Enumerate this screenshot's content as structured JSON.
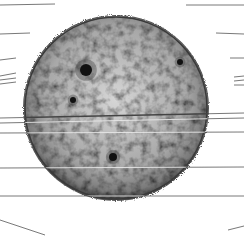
{
  "diagram": {
    "background": "#ffffff",
    "sun": {
      "cx": 116,
      "cy": 108,
      "r": 92,
      "fill_light": "#cfcfcf",
      "fill_dark": "#6a6a6a",
      "limb_color": "#3a3a3a"
    },
    "sunspots": [
      {
        "x": 86,
        "y": 70,
        "r": 6
      },
      {
        "x": 180,
        "y": 62,
        "r": 3
      },
      {
        "x": 73,
        "y": 100,
        "r": 3
      },
      {
        "x": 113,
        "y": 157,
        "r": 4
      }
    ],
    "leader_lines": [
      {
        "x1": 0,
        "y1": 5,
        "x2": 55,
        "y2": 4
      },
      {
        "x1": 0,
        "y1": 34,
        "x2": 30,
        "y2": 33
      },
      {
        "x1": 0,
        "y1": 60,
        "x2": 16,
        "y2": 58
      },
      {
        "x1": 0,
        "y1": 76,
        "x2": 16,
        "y2": 73
      },
      {
        "x1": 0,
        "y1": 80,
        "x2": 16,
        "y2": 78
      },
      {
        "x1": 0,
        "y1": 84,
        "x2": 16,
        "y2": 82
      },
      {
        "x1": 0,
        "y1": 118,
        "x2": 244,
        "y2": 113
      },
      {
        "x1": 0,
        "y1": 123,
        "x2": 244,
        "y2": 118
      },
      {
        "x1": 0,
        "y1": 133,
        "x2": 244,
        "y2": 132
      },
      {
        "x1": 0,
        "y1": 168,
        "x2": 244,
        "y2": 167
      },
      {
        "x1": 0,
        "y1": 196,
        "x2": 244,
        "y2": 196
      },
      {
        "x1": 0,
        "y1": 220,
        "x2": 45,
        "y2": 235
      },
      {
        "x1": 244,
        "y1": 5,
        "x2": 186,
        "y2": 5
      },
      {
        "x1": 244,
        "y1": 34,
        "x2": 216,
        "y2": 33
      },
      {
        "x1": 244,
        "y1": 58,
        "x2": 230,
        "y2": 58
      },
      {
        "x1": 244,
        "y1": 76,
        "x2": 234,
        "y2": 77
      },
      {
        "x1": 244,
        "y1": 80,
        "x2": 234,
        "y2": 81
      },
      {
        "x1": 244,
        "y1": 85,
        "x2": 234,
        "y2": 85
      },
      {
        "x1": 244,
        "y1": 226,
        "x2": 228,
        "y2": 230
      }
    ],
    "line_color": "#555555",
    "equator_band": {
      "y": 118,
      "color": "#444444"
    }
  }
}
